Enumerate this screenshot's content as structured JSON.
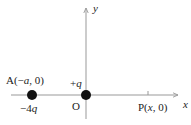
{
  "diagram": {
    "type": "coordinate-axes-point-charges",
    "axes": {
      "x_label": "x",
      "y_label": "y",
      "origin_label": "O",
      "line_color": "#999999"
    },
    "charges": [
      {
        "id": "A",
        "point_label": "A(−a, 0)",
        "charge_label": "−4q",
        "color": "#111111"
      },
      {
        "id": "O",
        "point_label": "O",
        "charge_label": "+q",
        "color": "#111111"
      }
    ],
    "points": [
      {
        "id": "P",
        "label": "P(x, 0)"
      }
    ]
  }
}
